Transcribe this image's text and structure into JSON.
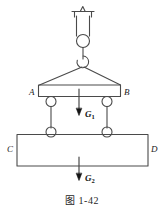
{
  "figure": {
    "caption": "图 1-42",
    "stroke_color": "#4a4a4a",
    "label_color": "#1a1a1a",
    "background_color": "#ffffff"
  },
  "labels": {
    "beam_left": "A",
    "beam_right": "B",
    "block_left": "C",
    "block_right": "D"
  },
  "forces": [
    {
      "name": "G1",
      "symbol": "G",
      "subscript": "1",
      "direction": "down",
      "applied_to": "beam-AB",
      "description": "Weight of spreader beam AB"
    },
    {
      "name": "G2",
      "symbol": "G",
      "subscript": "2",
      "direction": "down",
      "applied_to": "block-CD",
      "description": "Weight of suspended block CD"
    }
  ],
  "components": {
    "ceiling_anchor": "ceiling-support",
    "upper_ring": "ring",
    "lower_hook": "hook",
    "sling_cables": 2,
    "spreader_beam": "beam-AB",
    "link_rods": 2,
    "block": "block-CD"
  }
}
